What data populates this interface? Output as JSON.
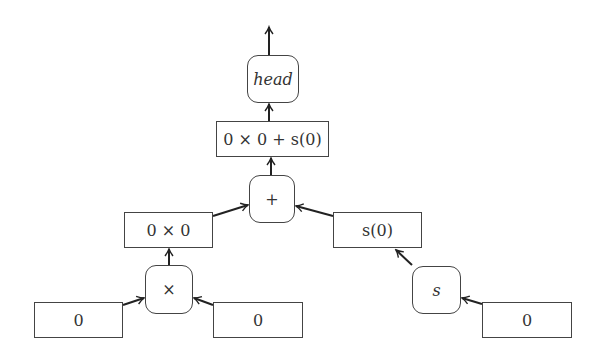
{
  "diagram": {
    "type": "expression-tree",
    "nodes": {
      "head": {
        "label": "head",
        "shape": "rounded"
      },
      "sum_expr": {
        "label": "0 × 0 + s(0)",
        "shape": "rect"
      },
      "plus": {
        "label": "+",
        "shape": "rounded"
      },
      "prod_expr": {
        "label": "0 × 0",
        "shape": "rect"
      },
      "succ_expr": {
        "label": "s(0)",
        "shape": "rect"
      },
      "times": {
        "label": "×",
        "shape": "rounded"
      },
      "s": {
        "label": "s",
        "shape": "rounded"
      },
      "zero_left": {
        "label": "0",
        "shape": "rect"
      },
      "zero_mid": {
        "label": "0",
        "shape": "rect"
      },
      "zero_right": {
        "label": "0",
        "shape": "rect"
      }
    },
    "edges": [
      {
        "from": "zero_left",
        "to": "times"
      },
      {
        "from": "zero_mid",
        "to": "times"
      },
      {
        "from": "times",
        "to": "prod_expr"
      },
      {
        "from": "zero_right",
        "to": "s"
      },
      {
        "from": "s",
        "to": "succ_expr"
      },
      {
        "from": "prod_expr",
        "to": "plus"
      },
      {
        "from": "succ_expr",
        "to": "plus"
      },
      {
        "from": "plus",
        "to": "sum_expr"
      },
      {
        "from": "sum_expr",
        "to": "head"
      },
      {
        "from": "head",
        "to": "output"
      }
    ]
  }
}
